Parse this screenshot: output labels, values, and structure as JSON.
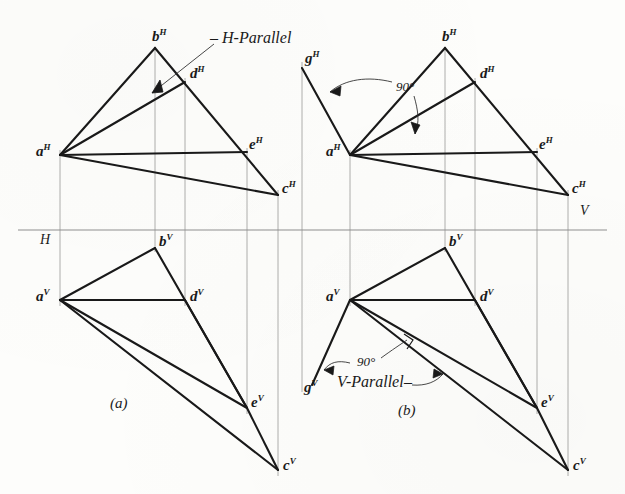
{
  "figure": {
    "colors": {
      "ink": "#1a1a1a",
      "thin_ink": "#8a8a8a",
      "paper": "#fdfdfb"
    },
    "reference_line": {
      "h_label": "H",
      "v_label": "V",
      "y": 230
    }
  },
  "subfigures": [
    {
      "key": "a",
      "caption": "(a)",
      "x": 117,
      "y": 405
    },
    {
      "key": "b",
      "caption": "(b)",
      "x": 405,
      "y": 412
    }
  ],
  "annotations": [
    {
      "name": "h-parallel-label",
      "text": "H-Parallel",
      "x": 215,
      "y": 38
    },
    {
      "name": "v-parallel-label",
      "text": "V-Parallel",
      "x": 337,
      "y": 381
    },
    {
      "name": "angle-top-b",
      "text": "90°",
      "x": 396,
      "y": 87
    },
    {
      "name": "angle-bottom-b",
      "text": "90°",
      "x": 357,
      "y": 362
    }
  ],
  "points": {
    "a_top_left": {
      "label": "a",
      "sup": "H",
      "x": 60,
      "y": 155,
      "tx": 36,
      "ty": 150
    },
    "b_top_left": {
      "label": "b",
      "sup": "H",
      "x": 155,
      "y": 48,
      "tx": 152,
      "ty": 36
    },
    "d_top_left": {
      "label": "d",
      "sup": "H",
      "x": 185,
      "y": 82,
      "tx": 190,
      "ty": 73
    },
    "e_top_left": {
      "label": "e",
      "sup": "H",
      "x": 247,
      "y": 152,
      "tx": 249,
      "ty": 144
    },
    "c_top_left": {
      "label": "c",
      "sup": "H",
      "x": 278,
      "y": 195,
      "tx": 282,
      "ty": 188
    },
    "a_bot_left": {
      "label": "a",
      "sup": "V",
      "x": 60,
      "y": 300,
      "tx": 36,
      "ty": 295
    },
    "b_bot_left": {
      "label": "b",
      "sup": "V",
      "x": 155,
      "y": 248,
      "tx": 159,
      "ty": 240
    },
    "d_bot_left": {
      "label": "d",
      "sup": "V",
      "x": 185,
      "y": 300,
      "tx": 190,
      "ty": 294
    },
    "e_bot_left": {
      "label": "e",
      "sup": "V",
      "x": 247,
      "y": 408,
      "tx": 251,
      "ty": 400
    },
    "c_bot_left": {
      "label": "c",
      "sup": "V",
      "x": 278,
      "y": 470,
      "tx": 283,
      "ty": 464
    },
    "a_top_right": {
      "label": "a",
      "sup": "H",
      "x": 350,
      "y": 155,
      "tx": 326,
      "ty": 150
    },
    "b_top_right": {
      "label": "b",
      "sup": "H",
      "x": 445,
      "y": 48,
      "tx": 442,
      "ty": 36
    },
    "d_top_right": {
      "label": "d",
      "sup": "H",
      "x": 475,
      "y": 82,
      "tx": 480,
      "ty": 73
    },
    "e_top_right": {
      "label": "e",
      "sup": "H",
      "x": 537,
      "y": 152,
      "tx": 539,
      "ty": 144
    },
    "c_top_right": {
      "label": "c",
      "sup": "H",
      "x": 568,
      "y": 195,
      "tx": 572,
      "ty": 188
    },
    "g_top_right": {
      "label": "g",
      "sup": "H",
      "x": 302,
      "y": 68,
      "tx": 305,
      "ty": 58
    },
    "a_bot_right": {
      "label": "a",
      "sup": "V",
      "x": 350,
      "y": 300,
      "tx": 326,
      "ty": 295
    },
    "b_bot_right": {
      "label": "b",
      "sup": "V",
      "x": 445,
      "y": 248,
      "tx": 449,
      "ty": 240
    },
    "d_bot_right": {
      "label": "d",
      "sup": "V",
      "x": 475,
      "y": 300,
      "tx": 480,
      "ty": 294
    },
    "e_bot_right": {
      "label": "e",
      "sup": "V",
      "x": 537,
      "y": 408,
      "tx": 541,
      "ty": 400
    },
    "c_bot_right": {
      "label": "c",
      "sup": "V",
      "x": 568,
      "y": 470,
      "tx": 573,
      "ty": 464
    },
    "g_bot_right": {
      "label": "g",
      "sup": "V",
      "x": 312,
      "y": 385,
      "tx": 305,
      "ty": 381
    }
  },
  "plane_labels": {
    "h": {
      "text": "H",
      "x": 40,
      "y": 233
    },
    "v": {
      "text": "V",
      "x": 580,
      "y": 205
    }
  }
}
